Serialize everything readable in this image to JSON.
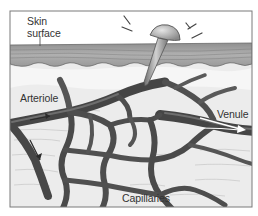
{
  "figure": {
    "labels": {
      "skin_surface_line1": "Skin",
      "skin_surface_line2": "surface",
      "arteriole": "Arteriole",
      "venule": "Venule",
      "capillaries": "Capillaries"
    },
    "objects": {
      "nail": "nail-icon",
      "impact_lines": "impact-lines-icon",
      "flow_arrows": "arrow-icon"
    },
    "colors": {
      "frame": "#7a7a7a",
      "skin_band": "#a8a8a8",
      "skin_band_dark": "#8c8c8c",
      "tissue": "#ededed",
      "vessel": "#4a4a4a",
      "vessel_light": "#6e6e6e",
      "nail": "#9a9a9a",
      "arrow": "#ffffff"
    }
  }
}
